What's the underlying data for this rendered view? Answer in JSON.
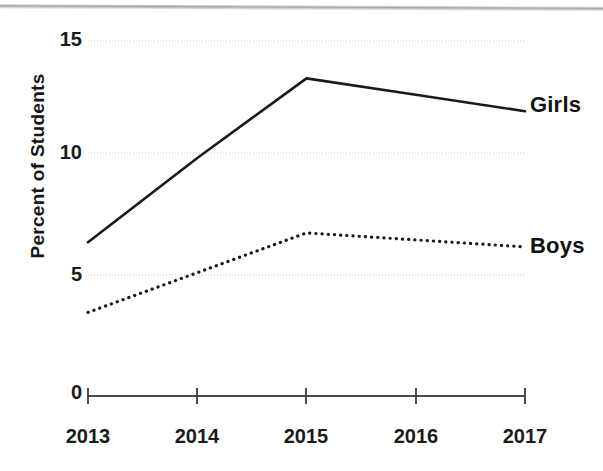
{
  "chart_data": {
    "type": "line",
    "title": "",
    "xlabel": "",
    "ylabel": "Percent of Students",
    "categories": [
      "2013",
      "2014",
      "2015",
      "2016",
      "2017"
    ],
    "x": [
      2013,
      2014,
      2015,
      2016,
      2017
    ],
    "series": [
      {
        "name": "Girls",
        "style": "solid",
        "color": "#1a1a1a",
        "values": [
          6.4,
          10.0,
          13.4,
          12.7,
          12.0
        ]
      },
      {
        "name": "Boys",
        "style": "dotted",
        "color": "#1a1a1a",
        "values": [
          3.4,
          5.1,
          6.8,
          6.5,
          6.2
        ]
      }
    ],
    "ylim": [
      0,
      15
    ],
    "yticks": [
      0,
      5,
      10,
      15
    ],
    "ytick_labels": [
      "0",
      "5",
      "10",
      "15"
    ],
    "xlim": [
      2013,
      2017
    ],
    "grid": "horizontal",
    "legend_position": "right-inline",
    "axis_color": "#3a3a3a",
    "gridline_color": "#d8d8d8"
  },
  "axis": {
    "y_title": "Percent of Students",
    "y_ticks": {
      "t15": "15",
      "t10": "10",
      "t5": "5",
      "t0": "0"
    },
    "x_ticks": {
      "t2013": "2013",
      "t2014": "2014",
      "t2015": "2015",
      "t2016": "2016",
      "t2017": "2017"
    }
  },
  "legend": {
    "girls": "Girls",
    "boys": "Boys"
  }
}
